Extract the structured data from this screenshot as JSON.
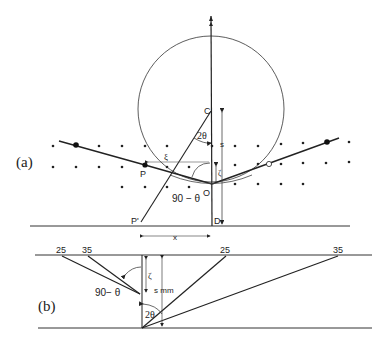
{
  "panel_a": {
    "label": "(a)",
    "points": {
      "C": "C",
      "O": "O",
      "P": "P",
      "P_prime": "P'",
      "D": "D"
    },
    "angles": {
      "two_theta": "2θ",
      "ninety_minus_theta": "90 − θ"
    },
    "dims": {
      "s": "s",
      "x": "x",
      "xi": "ξ",
      "zeta": "ζ"
    }
  },
  "panel_b": {
    "label": "(b)",
    "tick_labels_left": [
      "25",
      "35"
    ],
    "tick_labels_right": [
      "25",
      "35"
    ],
    "angles": {
      "two_theta": "2θ",
      "ninety_minus_theta": "90− θ"
    },
    "dims": {
      "s": "s mm",
      "zeta": "ζ"
    }
  }
}
